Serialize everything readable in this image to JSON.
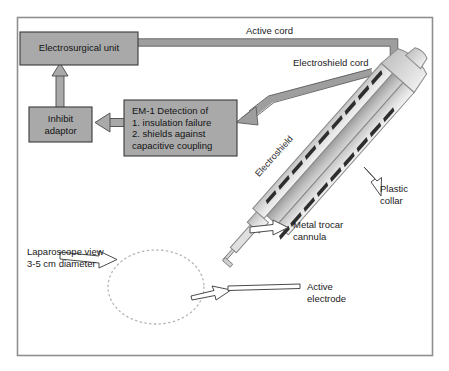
{
  "figure": {
    "type": "medical-device-schematic",
    "title_visible": false,
    "frame": {
      "border_color": "#8c8c8c",
      "background": "#ffffff"
    }
  },
  "colors": {
    "box_fill": "#a9a9a9",
    "box_stroke": "#3a3a3a",
    "cord_fill": "#9e9e9e",
    "cord_stroke": "#5a5a5a",
    "shaft_light": "#e8e8e8",
    "shaft_mid": "#c9c9c9",
    "shaft_dark": "#8f8f8f",
    "hatch_dark": "#2e2e2e",
    "outline_arrow_stroke": "#4a4a4a",
    "dotted_ellipse": "#b4b4b4",
    "text": "#141414"
  },
  "boxes": [
    {
      "id": "electrosurgical-unit",
      "label": "Electrosurgical unit",
      "lines": [
        "Electrosurgical unit"
      ],
      "x": 20,
      "y": 32,
      "w": 118,
      "h": 33
    },
    {
      "id": "inhibit-adaptor",
      "label": "Inhibit adaptor",
      "lines": [
        "Inhibit",
        "adaptor"
      ],
      "x": 29,
      "y": 107,
      "w": 63,
      "h": 35
    },
    {
      "id": "em1-detection",
      "label": "EM-1 Detection of",
      "lines": [
        "EM-1 Detection of",
        "1. insulation failure",
        "2. shields against",
        "capacitive coupling"
      ],
      "x": 124,
      "y": 100,
      "w": 113,
      "h": 56
    }
  ],
  "cords": [
    {
      "id": "active-cord",
      "label": "Active cord",
      "label_x": 246,
      "label_y": 25,
      "description": "Runs right from the electrosurgical unit then turns down into the instrument cap"
    },
    {
      "id": "electroshield-cord",
      "label": "Electroshield cord",
      "label_x": 293,
      "label_y": 57,
      "description": "Runs from instrument shaft down-left into the EM-1 detection box"
    }
  ],
  "callouts": [
    {
      "id": "plastic-collar",
      "lines": [
        "Plastic",
        "collar"
      ],
      "label_x": 380,
      "label_y": 183,
      "arrow": "outline-arrow-up-left"
    },
    {
      "id": "metal-trocar-cannula",
      "lines": [
        "Metal trocar",
        "cannula"
      ],
      "label_x": 316,
      "label_y": 224,
      "arrow": "outline-arrow-left"
    },
    {
      "id": "active-electrode",
      "lines": [
        "Active",
        "electrode"
      ],
      "label_x": 310,
      "label_y": 283,
      "arrow": "outline-arrow-left"
    },
    {
      "id": "laparoscope-view",
      "lines": [
        "Laparoscope view",
        "3-5 cm diameter"
      ],
      "label_x": 27,
      "label_y": 251,
      "arrow": "outline-arrow-right"
    }
  ],
  "shaft": {
    "id": "instrument-shaft",
    "rotated_label": "Electroshield",
    "rotation_deg": 48,
    "hatch_marks_upper": 9,
    "hatch_marks_lower": 9
  },
  "laparoscope_field": {
    "id": "laparoscope-ellipse",
    "style": "dotted",
    "cx": 156,
    "cy": 287,
    "rx": 48,
    "ry": 37
  }
}
